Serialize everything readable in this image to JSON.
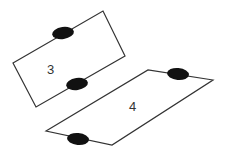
{
  "diagram": {
    "colors": {
      "stroke": "#333333",
      "fill": "#111111",
      "background": "#ffffff"
    },
    "shapes": [
      {
        "id": "3",
        "label": "3",
        "label_pos": [
          51,
          74
        ],
        "points": [
          [
            13,
            63
          ],
          [
            103,
            11
          ],
          [
            125,
            56
          ],
          [
            36,
            107
          ]
        ],
        "ellipses": [
          {
            "cx": 63,
            "cy": 33,
            "rx": 11,
            "ry": 6
          },
          {
            "cx": 77,
            "cy": 84,
            "rx": 11,
            "ry": 6
          }
        ]
      },
      {
        "id": "4",
        "label": "4",
        "label_pos": [
          133,
          111
        ],
        "points": [
          [
            46,
            131
          ],
          [
            148,
            70
          ],
          [
            213,
            80
          ],
          [
            112,
            145
          ]
        ],
        "ellipses": [
          {
            "cx": 178,
            "cy": 74,
            "rx": 11,
            "ry": 6
          },
          {
            "cx": 78,
            "cy": 139,
            "rx": 11,
            "ry": 6
          }
        ]
      }
    ]
  }
}
